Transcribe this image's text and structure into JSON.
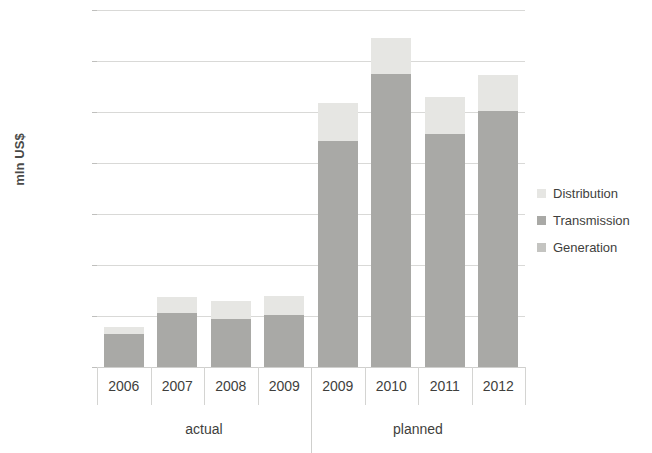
{
  "chart_data": {
    "type": "bar",
    "subtype": "stacked",
    "title": "",
    "xlabel": "",
    "ylabel": "mln US$",
    "ylim": [
      0,
      1400
    ],
    "ytick_step": 200,
    "ytick_labels": [
      "1,400",
      "1,200",
      "1,000",
      "800",
      "600",
      "400",
      "200",
      "0"
    ],
    "ytick_values": [
      1400,
      1200,
      1000,
      800,
      600,
      400,
      200,
      0
    ],
    "grid": true,
    "legend_position": "right",
    "categories": [
      "2006",
      "2007",
      "2008",
      "2009",
      "2009",
      "2010",
      "2011",
      "2012"
    ],
    "groups": [
      {
        "label": "actual",
        "categories": [
          "2006",
          "2007",
          "2008",
          "2009"
        ]
      },
      {
        "label": "planned",
        "categories": [
          "2009",
          "2010",
          "2011",
          "2012"
        ]
      }
    ],
    "series": [
      {
        "name": "Generation",
        "color": "#c4c4c1",
        "values": [
          0,
          0,
          0,
          0,
          0,
          0,
          0,
          0
        ]
      },
      {
        "name": "Transmission",
        "color": "#a9a9a6",
        "values": [
          128,
          212,
          190,
          205,
          888,
          1148,
          915,
          1005
        ]
      },
      {
        "name": "Distribution",
        "color": "#e6e6e3",
        "values": [
          28,
          62,
          70,
          72,
          147,
          142,
          145,
          140
        ]
      }
    ],
    "totals": [
      156,
      274,
      260,
      277,
      1035,
      1290,
      1060,
      1145
    ]
  },
  "legend": {
    "items": [
      {
        "label": "Distribution"
      },
      {
        "label": "Transmission"
      },
      {
        "label": "Generation"
      }
    ]
  }
}
